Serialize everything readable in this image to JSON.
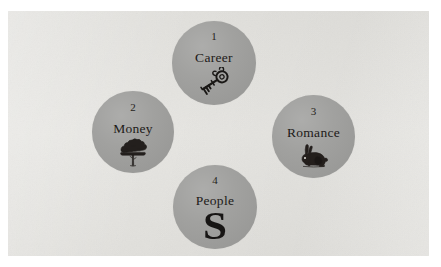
{
  "figure": {
    "kind": "four-circle-diagram",
    "background_color": "#ffffff",
    "panel_color": "#e3e2de",
    "circle_color": "#9d9d9b",
    "text_color": "#1d1a18"
  },
  "circles": [
    {
      "number": "1",
      "label": "Career",
      "icon": "key-icon",
      "position": "top"
    },
    {
      "number": "2",
      "label": "Money",
      "icon": "tree-icon",
      "position": "left"
    },
    {
      "number": "3",
      "label": "Romance",
      "icon": "rabbit-icon",
      "position": "right"
    },
    {
      "number": "4",
      "label": "People",
      "icon": "ornate-s-glyph",
      "glyph": "S",
      "position": "bottom"
    }
  ]
}
